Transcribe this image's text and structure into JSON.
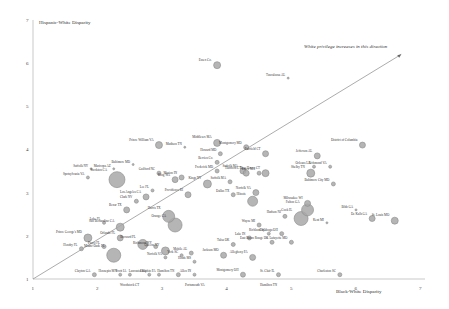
{
  "chart_data": {
    "type": "scatter",
    "subtype": "bubble",
    "title": "",
    "xlabel": "Black-White Disparity",
    "ylabel": "Hispanic-White Disparity",
    "xlim": [
      1,
      7
    ],
    "ylim": [
      1,
      7
    ],
    "x_ticks": [
      "1",
      "2",
      "3",
      "4",
      "5",
      "6",
      "7"
    ],
    "y_ticks": [
      "1",
      "2",
      "3",
      "4",
      "5",
      "6",
      "7"
    ],
    "grid": false,
    "legend": null,
    "annotation": "White privilege increases in this direction",
    "reference_line": {
      "from": [
        1,
        1
      ],
      "to": [
        6.7,
        6.2
      ],
      "arrow": true
    },
    "points": [
      {
        "label": "Essex Co.",
        "x": 3.85,
        "y": 5.95,
        "r": 3.5
      },
      {
        "label": "Tuscaloosa AL",
        "x": 4.95,
        "y": 5.65,
        "r": 1
      },
      {
        "label": "District of Columbia",
        "x": 6.1,
        "y": 4.1,
        "r": 3
      },
      {
        "label": "Prince William VA",
        "x": 2.95,
        "y": 4.1,
        "r": 3.5
      },
      {
        "label": "Middlesex MA",
        "x": 3.85,
        "y": 4.15,
        "r": 3.5
      },
      {
        "label": "Madison TN",
        "x": 3.35,
        "y": 4.05,
        "r": 1
      },
      {
        "label": "Montgomery MD",
        "x": 4.3,
        "y": 4.05,
        "r": 2.5
      },
      {
        "label": "Fairfield CT",
        "x": 4.6,
        "y": 3.9,
        "r": 3
      },
      {
        "label": "Howard MD",
        "x": 3.9,
        "y": 3.9,
        "r": 2
      },
      {
        "label": "Berrien Co.",
        "x": 3.85,
        "y": 3.7,
        "r": 2
      },
      {
        "label": "Baltimore MD",
        "x": 2.55,
        "y": 3.65,
        "r": 1
      },
      {
        "label": "Guilford NC",
        "x": 2.95,
        "y": 3.45,
        "r": 2
      },
      {
        "label": "Jefferson AL",
        "x": 5.4,
        "y": 3.85,
        "r": 3
      },
      {
        "label": "Frederick MD",
        "x": 3.85,
        "y": 3.5,
        "r": 2
      },
      {
        "label": "Suffolk MA",
        "x": 4.25,
        "y": 3.5,
        "r": 3
      },
      {
        "label": "Orleans LA",
        "x": 5.35,
        "y": 3.6,
        "r": 1.5
      },
      {
        "label": "Richmond VA",
        "x": 5.6,
        "y": 3.6,
        "r": 1.5
      },
      {
        "label": "Suffolk NY",
        "x": 1.9,
        "y": 3.55,
        "r": 1
      },
      {
        "label": "Maricopa AZ",
        "x": 2.25,
        "y": 3.55,
        "r": 1
      },
      {
        "label": "Hartford CT",
        "x": 4.3,
        "y": 3.45,
        "r": 3
      },
      {
        "label": "Essex MA",
        "x": 4.5,
        "y": 3.45,
        "r": 2
      },
      {
        "label": "New Haven CT",
        "x": 4.6,
        "y": 3.45,
        "r": 3.5
      },
      {
        "label": "Shelby TN",
        "x": 5.3,
        "y": 3.45,
        "r": 4
      },
      {
        "label": "Spotsylvania VA",
        "x": 1.85,
        "y": 3.35,
        "r": 1.5
      },
      {
        "label": "Marion IN",
        "x": 3.3,
        "y": 3.35,
        "r": 2.5
      },
      {
        "label": "Baltimore City MD",
        "x": 5.65,
        "y": 3.2,
        "r": 2
      },
      {
        "label": "King WA",
        "x": 3.2,
        "y": 3.3,
        "r": 3
      },
      {
        "label": "Stockton CA",
        "x": 2.3,
        "y": 3.3,
        "r": 8
      },
      {
        "label": "Kings NY",
        "x": 3.7,
        "y": 3.2,
        "r": 4
      },
      {
        "label": "Suffolk MA (2)",
        "x": 4.05,
        "y": 3.25,
        "r": 2
      },
      {
        "label": "Lee FL",
        "x": 2.85,
        "y": 3.05,
        "r": 1.5
      },
      {
        "label": "Providence RI",
        "x": 3.4,
        "y": 2.95,
        "r": 3
      },
      {
        "label": "Dallas TX",
        "x": 4.1,
        "y": 2.95,
        "r": 2
      },
      {
        "label": "Norfolk VA",
        "x": 4.45,
        "y": 3.0,
        "r": 3
      },
      {
        "label": "Los Angeles CA",
        "x": 2.75,
        "y": 2.9,
        "r": 3
      },
      {
        "label": "Clark NV",
        "x": 2.6,
        "y": 2.8,
        "r": 2
      },
      {
        "label": "Illinois",
        "x": 4.4,
        "y": 2.8,
        "r": 5
      },
      {
        "label": "Milwaukee WI",
        "x": 5.25,
        "y": 2.75,
        "r": 3
      },
      {
        "label": "Fulton GA",
        "x": 5.25,
        "y": 2.6,
        "r": 6
      },
      {
        "label": "Bexar TX",
        "x": 2.45,
        "y": 2.6,
        "r": 3
      },
      {
        "label": "Cook IL",
        "x": 5.15,
        "y": 2.4,
        "r": 7
      },
      {
        "label": "Hudson NJ",
        "x": 4.9,
        "y": 2.45,
        "r": 2
      },
      {
        "label": "Kent MI",
        "x": 5.55,
        "y": 2.3,
        "r": 1
      },
      {
        "label": "Bibb GA",
        "x": 6.0,
        "y": 2.6,
        "r": 1
      },
      {
        "label": "St. Louis MO",
        "x": 6.6,
        "y": 2.35,
        "r": 3.5
      },
      {
        "label": "De Kalb GA",
        "x": 6.25,
        "y": 2.4,
        "r": 3
      },
      {
        "label": "Lake FL",
        "x": 2.1,
        "y": 2.3,
        "r": 1.5
      },
      {
        "label": "San Bernardino CA",
        "x": 2.35,
        "y": 2.2,
        "r": 4
      },
      {
        "label": "Orange CA",
        "x": 3.2,
        "y": 2.25,
        "r": 7
      },
      {
        "label": "Harris TX",
        "x": 3.1,
        "y": 2.45,
        "r": 6
      },
      {
        "label": "Wayne MI",
        "x": 4.5,
        "y": 2.25,
        "r": 2
      },
      {
        "label": "Prince George's MD",
        "x": 1.85,
        "y": 1.95,
        "r": 4
      },
      {
        "label": "Orlando FL",
        "x": 2.35,
        "y": 1.95,
        "r": 3
      },
      {
        "label": "Richland SC",
        "x": 4.65,
        "y": 2.05,
        "r": 1.5
      },
      {
        "label": "Cuyahoga OH",
        "x": 4.85,
        "y": 2.05,
        "r": 2
      },
      {
        "label": "W. Lafayette MO",
        "x": 5.0,
        "y": 1.85,
        "r": 2
      },
      {
        "label": "Lake IN",
        "x": 4.35,
        "y": 1.95,
        "r": 2
      },
      {
        "label": "Tulsa OK",
        "x": 4.1,
        "y": 1.8,
        "r": 2
      },
      {
        "label": "Hendry FL",
        "x": 1.75,
        "y": 1.7,
        "r": 2
      },
      {
        "label": "Pasco FL",
        "x": 2.1,
        "y": 1.75,
        "r": 2
      },
      {
        "label": "Miami-Dade FL",
        "x": 2.25,
        "y": 1.55,
        "r": 7
      },
      {
        "label": "Broward FL",
        "x": 2.7,
        "y": 1.8,
        "r": 5
      },
      {
        "label": "Richmond NY",
        "x": 2.9,
        "y": 1.75,
        "r": 2
      },
      {
        "label": "Queens NY",
        "x": 3.05,
        "y": 1.65,
        "r": 4
      },
      {
        "label": "Mobile AL",
        "x": 3.45,
        "y": 1.6,
        "r": 2
      },
      {
        "label": "York SC",
        "x": 3.3,
        "y": 1.55,
        "r": 1.5
      },
      {
        "label": "Norfolk VA (2)",
        "x": 3.05,
        "y": 1.5,
        "r": 1.5
      },
      {
        "label": "Hinds MS",
        "x": 3.5,
        "y": 1.4,
        "r": 1.5
      },
      {
        "label": "Jackson MO",
        "x": 3.95,
        "y": 1.55,
        "r": 3
      },
      {
        "label": "Allegheny PA",
        "x": 4.4,
        "y": 1.5,
        "r": 3
      },
      {
        "label": "East Baton Rouge LA",
        "x": 4.7,
        "y": 1.85,
        "r": 2
      },
      {
        "label": "Montgomery OH",
        "x": 4.25,
        "y": 1.1,
        "r": 2.5
      },
      {
        "label": "St. Clair IL",
        "x": 4.8,
        "y": 1.1,
        "r": 2
      },
      {
        "label": "Charleston SC",
        "x": 5.75,
        "y": 1.1,
        "r": 2
      },
      {
        "label": "Clayton GA",
        "x": 1.95,
        "y": 1.1,
        "r": 2
      },
      {
        "label": "Hennepin MN",
        "x": 2.35,
        "y": 1.1,
        "r": 1.5
      },
      {
        "label": "Scott IA",
        "x": 2.5,
        "y": 1.1,
        "r": 1.5
      },
      {
        "label": "Lancaster PA",
        "x": 2.8,
        "y": 1.1,
        "r": 1.5
      },
      {
        "label": "Dauphin PA",
        "x": 2.95,
        "y": 1.1,
        "r": 1.5
      },
      {
        "label": "Hamilton TN",
        "x": 3.25,
        "y": 1.1,
        "r": 2
      },
      {
        "label": "Allen IN",
        "x": 3.5,
        "y": 1.1,
        "r": 1.5
      }
    ],
    "axis_labels_below": [
      "Woodstock CT",
      "Portsmouth VA",
      "Hamilton TN"
    ]
  }
}
